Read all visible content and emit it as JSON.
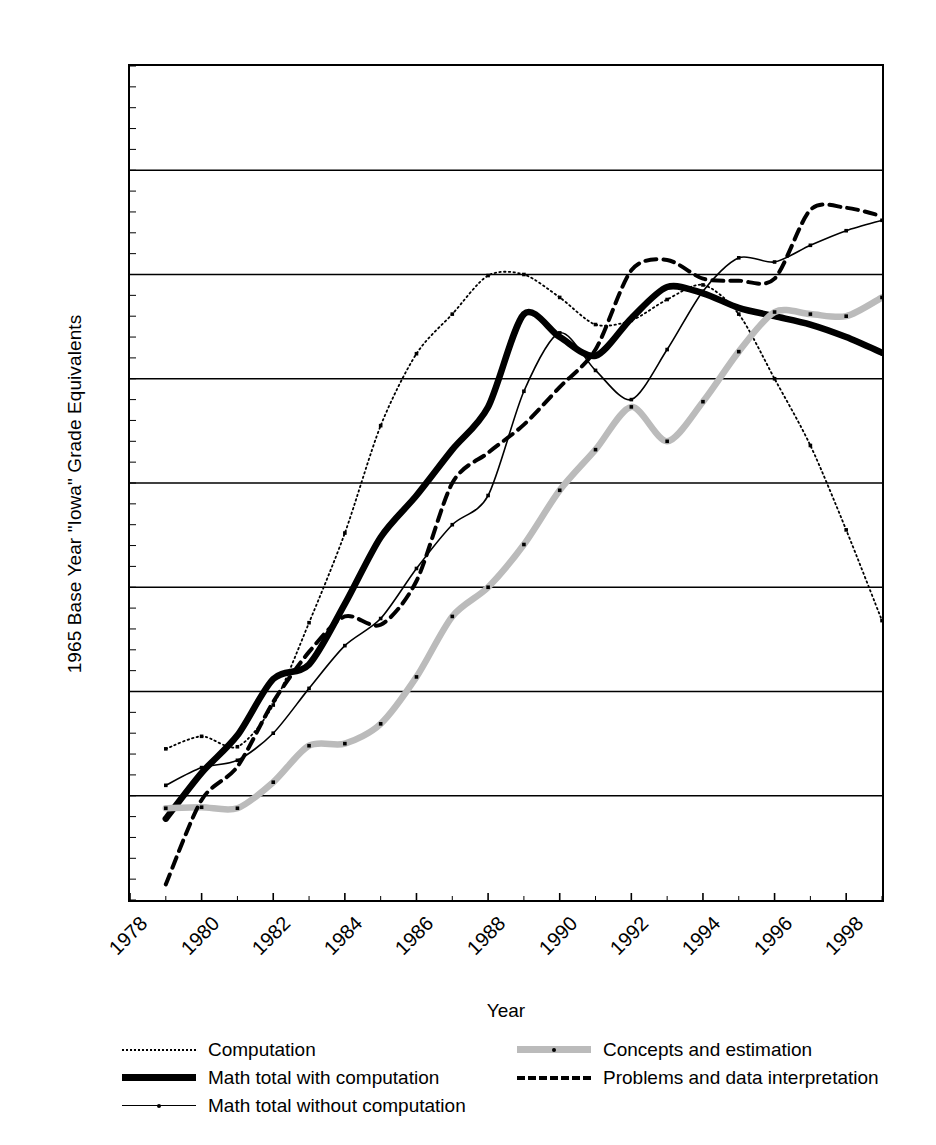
{
  "chart_data": {
    "type": "line",
    "title": "",
    "xlabel": "Year",
    "ylabel": "1965 Base Year \"Iowa\" Grade Equivalents",
    "xlim": [
      1978,
      1999
    ],
    "ylim": [
      7.6,
      8.4
    ],
    "xticks": [
      1978,
      1980,
      1982,
      1984,
      1986,
      1988,
      1990,
      1992,
      1994,
      1996,
      1998
    ],
    "yticks": [
      "7.6",
      "7.7",
      "7.8",
      "7.9",
      "8",
      "8.1",
      "8.2",
      "8.3",
      "8.4"
    ],
    "grid": "horizontal",
    "legend_position": "below",
    "x": [
      1979,
      1980,
      1981,
      1982,
      1983,
      1984,
      1985,
      1986,
      1987,
      1988,
      1989,
      1990,
      1991,
      1992,
      1993,
      1994,
      1995,
      1996,
      1997,
      1998,
      1999
    ],
    "series": [
      {
        "name": "Computation",
        "style": "dotted",
        "values": [
          7.745,
          7.757,
          7.747,
          7.787,
          7.866,
          7.952,
          8.055,
          8.124,
          8.162,
          8.199,
          8.2,
          8.178,
          8.152,
          8.156,
          8.176,
          8.19,
          8.162,
          8.1,
          8.036,
          7.955,
          7.868
        ]
      },
      {
        "name": "Math total with computation",
        "style": "thick-solid",
        "values": [
          7.678,
          7.722,
          7.758,
          7.812,
          7.826,
          7.884,
          7.948,
          7.988,
          8.032,
          8.073,
          8.162,
          8.14,
          8.122,
          8.158,
          8.188,
          8.182,
          8.168,
          8.16,
          8.152,
          8.14,
          8.125
        ]
      },
      {
        "name": "Math total without computation",
        "style": "thin-solid-marker",
        "values": [
          7.71,
          7.727,
          7.734,
          7.76,
          7.803,
          7.844,
          7.87,
          7.918,
          7.96,
          7.988,
          8.088,
          8.144,
          8.108,
          8.08,
          8.128,
          8.184,
          8.216,
          8.212,
          8.228,
          8.242,
          8.252
        ]
      },
      {
        "name": "Concepts and estimation",
        "style": "thick-gray-marker",
        "values": [
          7.688,
          7.689,
          7.688,
          7.713,
          7.748,
          7.75,
          7.769,
          7.814,
          7.872,
          7.9,
          7.941,
          7.993,
          8.032,
          8.073,
          8.04,
          8.078,
          8.126,
          8.164,
          8.162,
          8.16,
          8.178
        ]
      },
      {
        "name": "Problems and data interpretation",
        "style": "dashed",
        "values": [
          7.615,
          7.696,
          7.728,
          7.79,
          7.838,
          7.872,
          7.864,
          7.906,
          8.0,
          8.029,
          8.056,
          8.092,
          8.128,
          8.204,
          8.214,
          8.196,
          8.194,
          8.196,
          8.262,
          8.264,
          8.256
        ]
      }
    ]
  },
  "axis": {
    "ylabel_text": "1965 Base Year \"Iowa\" Grade Equivalents",
    "xlabel_text": "Year"
  },
  "legend": {
    "left": [
      {
        "label": "Computation",
        "style": "dotted"
      },
      {
        "label": "Math total with computation",
        "style": "thick-solid"
      },
      {
        "label": "Math total without computation",
        "style": "thin-solid-marker"
      }
    ],
    "right": [
      {
        "label": "Concepts and estimation",
        "style": "thick-gray-marker"
      },
      {
        "label": "Problems and data interpretation",
        "style": "dashed"
      }
    ]
  },
  "colors": {
    "axis": "#000000",
    "grid": "#000000",
    "series_gray": "#bbbbbb",
    "background": "#ffffff"
  }
}
